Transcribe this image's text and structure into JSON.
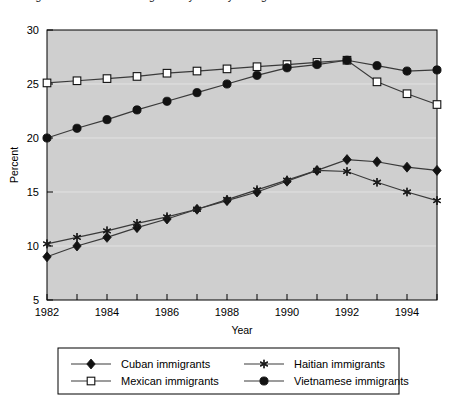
{
  "chart_data": {
    "type": "line",
    "title": "",
    "xlabel": "Year",
    "ylabel": "Percent",
    "xlim": [
      1982,
      1995
    ],
    "ylim": [
      5,
      30
    ],
    "ytick_step": 5,
    "yticks": [
      5,
      10,
      15,
      20,
      25,
      30
    ],
    "ytick_labels": [
      "5",
      "10",
      "15",
      "20",
      "25",
      "30"
    ],
    "xticks": [
      1982,
      1983,
      1984,
      1985,
      1986,
      1987,
      1988,
      1989,
      1990,
      1991,
      1992,
      1993,
      1994,
      1995
    ],
    "xtick_labels_shown": [
      "1982",
      "1984",
      "1986",
      "1988",
      "1990",
      "1992",
      "1994"
    ],
    "xtick_label_years": [
      1982,
      1984,
      1986,
      1988,
      1990,
      1992,
      1994
    ],
    "grid": true,
    "grid_axis": "y",
    "legend_position": "bottom",
    "plot_background": "#cfcfcf",
    "line_color": "#3a3a3a",
    "x": [
      1982,
      1983,
      1984,
      1985,
      1986,
      1987,
      1988,
      1989,
      1990,
      1991,
      1992,
      1993,
      1994,
      1995
    ],
    "series": [
      {
        "name": "Cuban immigrants",
        "marker": "filled-diamond",
        "values": [
          9.0,
          10.0,
          10.8,
          11.7,
          12.5,
          13.4,
          14.2,
          15.0,
          16.0,
          17.0,
          18.0,
          17.8,
          17.3,
          17.0
        ]
      },
      {
        "name": "Mexican immigrants",
        "marker": "open-square",
        "values": [
          25.1,
          25.3,
          25.5,
          25.7,
          26.0,
          26.2,
          26.4,
          26.6,
          26.8,
          27.0,
          27.2,
          25.2,
          24.1,
          23.1
        ]
      },
      {
        "name": "Haitian immigrants",
        "marker": "asterisk",
        "values": [
          10.2,
          10.8,
          11.4,
          12.1,
          12.7,
          13.4,
          14.3,
          15.2,
          16.1,
          17.0,
          16.9,
          15.9,
          15.0,
          14.2
        ]
      },
      {
        "name": "Vietnamese immigrants",
        "marker": "filled-circle",
        "values": [
          20.0,
          20.9,
          21.7,
          22.6,
          23.4,
          24.2,
          25.0,
          25.8,
          26.5,
          26.8,
          27.2,
          26.7,
          26.2,
          26.3
        ]
      }
    ],
    "legend_entries": [
      {
        "label": "Cuban immigrants",
        "marker": "filled-diamond"
      },
      {
        "label": "Haitian immigrants",
        "marker": "asterisk"
      },
      {
        "label": "Mexican immigrants",
        "marker": "open-square"
      },
      {
        "label": "Vietnamese immigrants",
        "marker": "filled-circle"
      }
    ]
  },
  "top_cropped_text": "Figure 1. Percent of immigrants by country of origin"
}
